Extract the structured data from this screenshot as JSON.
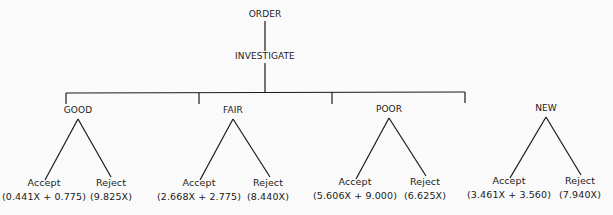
{
  "diagram": {
    "type": "decision-tree",
    "root": {
      "label": "ORDER",
      "child": {
        "label": "INVESTIGATE",
        "children": [
          {
            "label": "GOOD",
            "accept": {
              "label": "Accept",
              "formula": "(0.441X + 0.775)"
            },
            "reject": {
              "label": "Reject",
              "formula": "(9.825X)"
            }
          },
          {
            "label": "FAIR",
            "accept": {
              "label": "Accept",
              "formula": "(2.668X + 2.775)"
            },
            "reject": {
              "label": "Reject",
              "formula": "(8.440X)"
            }
          },
          {
            "label": "POOR",
            "accept": {
              "label": "Accept",
              "formula": "(5.606X + 9.000)"
            },
            "reject": {
              "label": "Reject",
              "formula": "(6.625X)"
            }
          },
          {
            "label": "NEW",
            "accept": {
              "label": "Accept",
              "formula": "(3.461X + 3.560)"
            },
            "reject": {
              "label": "Reject",
              "formula": "(7.940X)"
            }
          }
        ]
      }
    }
  }
}
